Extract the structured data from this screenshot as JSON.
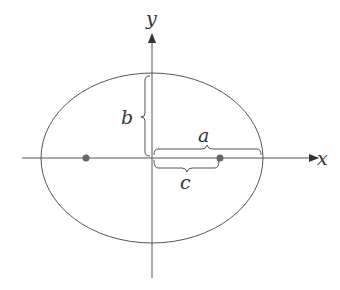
{
  "diagram": {
    "labels": {
      "x_axis": "x",
      "y_axis": "y",
      "semi_major": "a",
      "semi_minor": "b",
      "focal_distance": "c"
    },
    "geometry": {
      "center": [
        152,
        158
      ],
      "semi_major_px": 111,
      "semi_minor_px": 84,
      "foci": [
        [
          86,
          158
        ],
        [
          220,
          158
        ]
      ]
    },
    "colors": {
      "stroke": "#555555",
      "focus": "#666666",
      "background": "#ffffff"
    }
  }
}
